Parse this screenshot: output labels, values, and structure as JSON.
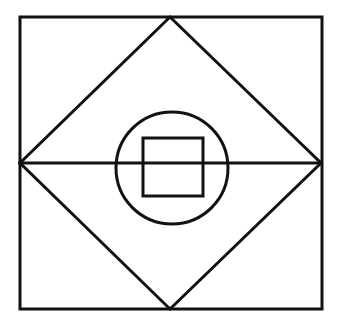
{
  "diagram": {
    "stroke_color": "#111111",
    "background": "#ffffff",
    "stroke_width": 3,
    "outer_square": {
      "x": 20,
      "y": 17,
      "width": 302,
      "height": 292
    },
    "diamond": {
      "top": [
        170,
        17
      ],
      "right": [
        321,
        163
      ],
      "bottom": [
        170,
        309
      ],
      "left": [
        20,
        163
      ]
    },
    "midline": {
      "x1": 18,
      "y1": 163,
      "x2": 321,
      "y2": 163
    },
    "circle": {
      "cx": 172,
      "cy": 168,
      "r": 56
    },
    "inner_square": {
      "x": 143,
      "y": 138,
      "width": 60,
      "height": 58
    }
  }
}
